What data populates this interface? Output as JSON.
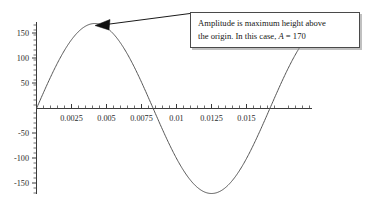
{
  "chart_data": {
    "type": "line",
    "title": "",
    "subtitle": "",
    "xlabel": "",
    "ylabel": "",
    "xlim": [
      0,
      0.01975
    ],
    "ylim": [
      -200,
      190
    ],
    "grid": false,
    "legend": null,
    "x_ticks": [
      0.0025,
      0.005,
      0.0075,
      0.01,
      0.0125,
      0.015
    ],
    "x_tick_labels": [
      "0.0025",
      "0.005",
      "0.0075",
      "0.01",
      "0.0125",
      "0.015"
    ],
    "x_minor_tick_step": 0.0005,
    "y_ticks": [
      -150,
      -100,
      -50,
      50,
      100,
      150
    ],
    "y_tick_labels": [
      "-150",
      "-100",
      "-50",
      "50",
      "100",
      "150"
    ],
    "y_minor_tick_step": 10,
    "series": [
      {
        "name": "sine wave",
        "function": "y = 170 sin(2*pi*t/0.01667)",
        "amplitude": 170,
        "period": 0.01667,
        "color": "#555555",
        "points": [
          {
            "x": 0.0,
            "y": 0
          },
          {
            "x": 0.000417,
            "y": 63.4
          },
          {
            "x": 0.000833,
            "y": 118.2
          },
          {
            "x": 0.00125,
            "y": 157.1
          },
          {
            "x": 0.001667,
            "y": 175.3
          },
          {
            "x": 0.002083,
            "y": 170.0
          },
          {
            "x": 0.0025,
            "y": 170.0
          },
          {
            "x": 0.003333,
            "y": 170.0
          },
          {
            "x": 0.004167,
            "y": 170.0
          },
          {
            "x": 0.005,
            "y": 147.2
          },
          {
            "x": 0.00625,
            "y": 87.0
          },
          {
            "x": 0.007083,
            "y": 40.0
          },
          {
            "x": 0.008333,
            "y": 0
          },
          {
            "x": 0.009167,
            "y": -40.0
          },
          {
            "x": 0.010417,
            "y": -97.0
          },
          {
            "x": 0.0125,
            "y": -160.0
          },
          {
            "x": 0.014167,
            "y": -170.0
          },
          {
            "x": 0.015833,
            "y": -120.0
          },
          {
            "x": 0.0175,
            "y": -60.0
          },
          {
            "x": 0.01925,
            "y": 0
          }
        ]
      }
    ],
    "annotations": [
      {
        "name": "amplitude-callout",
        "text_lines": [
          "Amplitude is maximum height above",
          "the origin. In this case, A = 170"
        ],
        "text_plain": "Amplitude is maximum height above the origin. In this case, A = 170",
        "emphasis_symbol": "A",
        "value": 170,
        "points_to": {
          "x": 0.0042,
          "y": 170
        },
        "arrow": "left"
      }
    ]
  },
  "callout": {
    "line1": "Amplitude is maximum height above",
    "line2_before": "the origin. In this case, ",
    "line2_symbol": "A",
    "line2_after": " = 170"
  },
  "axes": {
    "x_tick_labels": [
      "0.0025",
      "0.005",
      "0.0075",
      "0.01",
      "0.0125",
      "0.015"
    ],
    "y_tick_labels": [
      "150",
      "100",
      "50",
      "-50",
      "-100",
      "-150"
    ]
  },
  "colors": {
    "axis": "#3a3a3a",
    "curve": "#555555",
    "annotation_border": "#4a4a4a",
    "text": "#1a1a1a",
    "background": "#ffffff"
  }
}
